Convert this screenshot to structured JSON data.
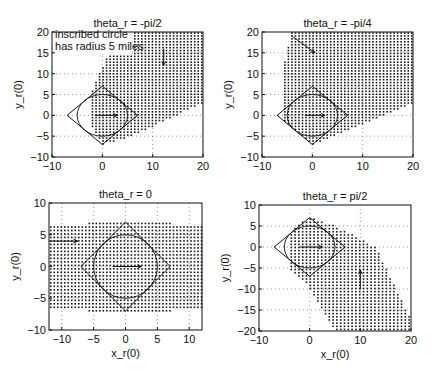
{
  "figure": {
    "annotation": [
      "inscribed circle",
      "has radius 5 miles"
    ]
  },
  "chart_data": [
    {
      "type": "scatter",
      "title": "theta_r = -pi/2",
      "xlabel": "",
      "ylabel": "y_r(0)",
      "xlim": [
        -10,
        20
      ],
      "ylim": [
        -10,
        20
      ],
      "xticks": [
        -10,
        0,
        10,
        20
      ],
      "yticks": [
        -10,
        -5,
        0,
        5,
        10,
        15,
        20
      ],
      "grid": true,
      "box": {
        "left": 52,
        "top": 32,
        "right": 203,
        "bottom": 157
      },
      "dot_step": 0.7,
      "region": [
        [
          -2,
          6
        ],
        [
          3,
          20
        ],
        [
          20,
          20
        ],
        [
          20,
          3
        ],
        [
          6,
          -5
        ],
        [
          0,
          -7
        ],
        [
          -2,
          -3
        ]
      ],
      "diamond": [
        [
          -7,
          0
        ],
        [
          0,
          7
        ],
        [
          7,
          0
        ],
        [
          0,
          -7
        ]
      ],
      "circle_radius": 5,
      "own_arrow": {
        "from": [
          -1.5,
          0
        ],
        "to": [
          3,
          0
        ]
      },
      "intruder_arrow": {
        "from": [
          12.2,
          16
        ],
        "to": [
          12.2,
          12
        ]
      },
      "annotation_pos": [
        -9.4,
        18.6
      ]
    },
    {
      "type": "scatter",
      "title": "theta_r = -pi/4",
      "xlabel": "",
      "ylabel": "y_r(0)",
      "xlim": [
        -10,
        20
      ],
      "ylim": [
        -10,
        20
      ],
      "xticks": [
        -10,
        0,
        10,
        20
      ],
      "yticks": [
        -10,
        -5,
        0,
        5,
        10,
        15,
        20
      ],
      "grid": true,
      "box": {
        "left": 262,
        "top": 32,
        "right": 413,
        "bottom": 157
      },
      "dot_step": 0.7,
      "region": [
        [
          -4,
          20
        ],
        [
          20,
          20
        ],
        [
          20,
          3
        ],
        [
          6,
          -4
        ],
        [
          0,
          -7
        ],
        [
          -6,
          -1
        ],
        [
          -6,
          10
        ]
      ],
      "diamond": [
        [
          -7,
          0
        ],
        [
          0,
          7
        ],
        [
          7,
          0
        ],
        [
          0,
          -7
        ]
      ],
      "circle_radius": 5,
      "own_arrow": {
        "from": [
          -1.5,
          0
        ],
        "to": [
          2.5,
          0
        ]
      },
      "intruder_arrow": {
        "from": [
          -4,
          19
        ],
        "to": [
          0.5,
          15
        ]
      }
    },
    {
      "type": "scatter",
      "title": "theta_r = 0",
      "xlabel": "x_r(0)",
      "ylabel": "y_r(0)",
      "xlim": [
        -12,
        12
      ],
      "ylim": [
        -10,
        10
      ],
      "xticks": [
        -10,
        -5,
        0,
        5,
        10
      ],
      "yticks": [
        -10,
        -5,
        0,
        5,
        10
      ],
      "grid": true,
      "box": {
        "left": 49,
        "top": 203,
        "right": 202,
        "bottom": 330
      },
      "dot_step": 0.55,
      "region": [
        [
          -12,
          6.5
        ],
        [
          -6,
          6.5
        ],
        [
          -6,
          7.2
        ],
        [
          7,
          7.2
        ],
        [
          7,
          6.5
        ],
        [
          12,
          6.5
        ],
        [
          12,
          -6.5
        ],
        [
          7,
          -6.5
        ],
        [
          7,
          -7.2
        ],
        [
          -6,
          -7.2
        ],
        [
          -6,
          -6.5
        ],
        [
          -12,
          -6.5
        ]
      ],
      "diamond": [
        [
          -7,
          0
        ],
        [
          0,
          7
        ],
        [
          7,
          0
        ],
        [
          0,
          -7
        ]
      ],
      "circle_radius": 5,
      "own_arrow": {
        "from": [
          -2,
          0
        ],
        "to": [
          2.5,
          0
        ]
      },
      "intruder_arrow": {
        "from": [
          -12,
          4
        ],
        "to": [
          -7.5,
          4
        ]
      }
    },
    {
      "type": "scatter",
      "title": "theta_r = pi/2",
      "xlabel": "x_r(0)",
      "ylabel": "y_r(0)",
      "xlim": [
        -10,
        20
      ],
      "ylim": [
        -20,
        10
      ],
      "xticks": [
        -10,
        0,
        10,
        20
      ],
      "yticks": [
        -20,
        -15,
        -10,
        -5,
        0,
        5,
        10
      ],
      "grid": true,
      "box": {
        "left": 259,
        "top": 205,
        "right": 411,
        "bottom": 331
      },
      "dot_step": 0.75,
      "region": [
        [
          -3,
          5
        ],
        [
          0,
          7
        ],
        [
          5,
          5
        ],
        [
          13,
          0
        ],
        [
          15,
          -5
        ],
        [
          19,
          -15
        ],
        [
          20,
          -17
        ],
        [
          20,
          -20
        ],
        [
          5,
          -20
        ],
        [
          -1,
          -8
        ],
        [
          -4,
          -5
        ],
        [
          -4,
          2
        ]
      ],
      "diamond": [
        [
          -7,
          0
        ],
        [
          0,
          7
        ],
        [
          7,
          0
        ],
        [
          0,
          -7
        ]
      ],
      "circle_radius": 5,
      "own_arrow": {
        "from": [
          -2,
          0
        ],
        "to": [
          2.5,
          0
        ]
      },
      "intruder_arrow": {
        "from": [
          10,
          -10
        ],
        "to": [
          10,
          -5.5
        ]
      }
    }
  ]
}
